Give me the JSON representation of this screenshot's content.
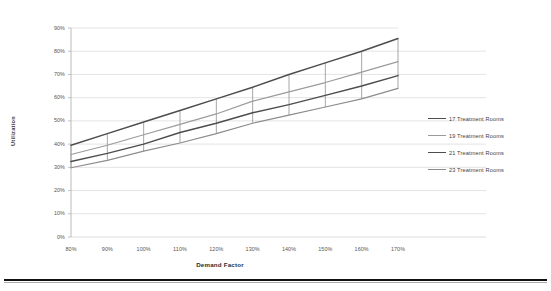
{
  "chart_data": {
    "type": "line",
    "title": "",
    "xlabel": "Demand Factor",
    "ylabel": "Utilization",
    "categories": [
      "80%",
      "90%",
      "100%",
      "110%",
      "120%",
      "130%",
      "140%",
      "150%",
      "160%",
      "170%"
    ],
    "x": [
      80,
      90,
      100,
      110,
      120,
      130,
      140,
      150,
      160,
      170
    ],
    "xlim": [
      80,
      170
    ],
    "ylim": [
      0,
      90
    ],
    "ytick_labels": [
      "0%",
      "10%",
      "20%",
      "30%",
      "40%",
      "50%",
      "60%",
      "70%",
      "80%",
      "90%"
    ],
    "yticks": [
      0,
      10,
      20,
      30,
      40,
      50,
      60,
      70,
      80,
      90
    ],
    "grid": "horizontal",
    "legend_position": "right",
    "series": [
      {
        "name": "17 Treatment Rooms",
        "color": "#4d4d4d",
        "values": [
          39.5,
          44.5,
          49.5,
          54.5,
          59.5,
          64.5,
          70.0,
          75.0,
          80.0,
          85.5
        ]
      },
      {
        "name": "19 Treatment Rooms",
        "color": "#9b9b9b",
        "values": [
          35.5,
          39.5,
          44.0,
          48.5,
          53.0,
          58.5,
          62.5,
          66.5,
          71.0,
          75.5
        ]
      },
      {
        "name": "21 Treatment Rooms",
        "color": "#4d4d4d",
        "values": [
          32.5,
          36.0,
          40.0,
          45.0,
          49.0,
          53.5,
          57.0,
          61.0,
          65.0,
          69.5
        ]
      },
      {
        "name": "23 Treatment Rooms",
        "color": "#8c8c8c",
        "values": [
          29.8,
          33.0,
          37.0,
          40.5,
          44.5,
          49.0,
          52.5,
          56.0,
          59.5,
          64.0
        ]
      }
    ],
    "connector_lines": true,
    "axis_color": "#b3b3b3",
    "grid_color": "#d9d9d9"
  },
  "legend": {
    "items": [
      {
        "label": "17 Treatment Rooms",
        "color": "#4d4d4d"
      },
      {
        "label": "19 Treatment Rooms",
        "color": "#9b9b9b"
      },
      {
        "label": "21 Treatment Rooms",
        "color": "#4d4d4d"
      },
      {
        "label": "23 Treatment Rooms",
        "color": "#8c8c8c"
      }
    ]
  }
}
